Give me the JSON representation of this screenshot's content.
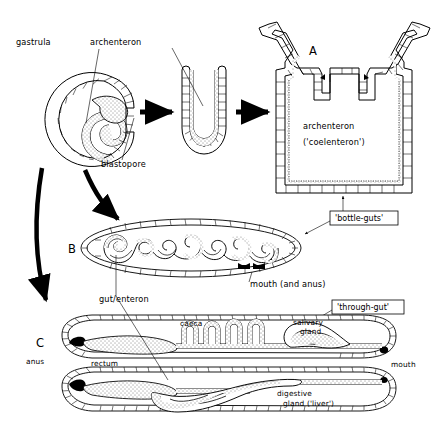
{
  "figure": {
    "background_color": "#ffffff",
    "ink_color": "#000000",
    "width": 436,
    "height": 441
  },
  "stage_gastrula": {
    "label_gastrula": "gastrula",
    "label_archenteron": "archenteron",
    "label_blastopore": "blastopore"
  },
  "stage_u": {
    "name": "u-shaped-archenteron"
  },
  "panel_a": {
    "letter": "A",
    "cavity_line1": "archenteron",
    "cavity_line2": "('coelenteron')",
    "callout": "'bottle-guts'"
  },
  "panel_b": {
    "letter": "B",
    "label_mouth_anus": "mouth (and anus)",
    "label_gut_enteron": "gut/enteron"
  },
  "panel_c": {
    "letter": "C",
    "callout": "'through-gut'",
    "label_anus": "anus",
    "label_mouth": "mouth",
    "label_rectum": "rectum",
    "label_caeca": "caeca",
    "label_salivary_line1": "salivary",
    "label_salivary_line2": "gland",
    "label_digestive_line1": "digestive",
    "label_digestive_line2": "gland ('liver')"
  },
  "arrows": {
    "gastrula_to_u": "straight-arrow-right",
    "u_to_a": "straight-arrow-right",
    "gastrula_to_b": "curved-arrow-down-right",
    "gastrula_to_c": "curved-arrow-down"
  }
}
